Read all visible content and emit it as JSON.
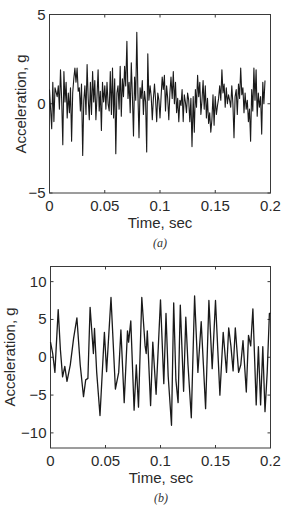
{
  "chart_data": [
    {
      "type": "line",
      "panel": "a",
      "caption": "(a)",
      "title": "",
      "xlabel": "Time, sec",
      "ylabel": "Acceleration, g",
      "xlim": [
        0,
        0.2
      ],
      "ylim": [
        -5,
        5
      ],
      "xticks": [
        0,
        0.05,
        0.1,
        0.15,
        0.2
      ],
      "xtick_labels": [
        "0",
        "0.05",
        "0.1",
        "0.15",
        "0.2"
      ],
      "yticks": [
        -5,
        0,
        5
      ],
      "ytick_labels": [
        "−5",
        "0",
        "5"
      ],
      "grid": false,
      "legend": null,
      "description": "Broadband random vibration signal, roughly zero mean, amplitude mostly within ±2 g, max peak about 4 g near t=0.08 s, min about −3 g",
      "x": [
        0.0,
        0.002,
        0.003,
        0.004,
        0.005,
        0.007,
        0.008,
        0.009,
        0.01,
        0.011,
        0.012,
        0.013,
        0.014,
        0.015,
        0.016,
        0.017,
        0.018,
        0.019,
        0.02,
        0.021,
        0.022,
        0.023,
        0.024,
        0.025,
        0.026,
        0.027,
        0.028,
        0.029,
        0.03,
        0.031,
        0.032,
        0.033,
        0.034,
        0.035,
        0.036,
        0.037,
        0.038,
        0.039,
        0.04,
        0.041,
        0.042,
        0.043,
        0.044,
        0.045,
        0.046,
        0.047,
        0.048,
        0.049,
        0.05,
        0.051,
        0.052,
        0.053,
        0.054,
        0.055,
        0.056,
        0.057,
        0.058,
        0.059,
        0.06,
        0.061,
        0.062,
        0.063,
        0.064,
        0.065,
        0.066,
        0.067,
        0.068,
        0.069,
        0.07,
        0.071,
        0.072,
        0.073,
        0.074,
        0.075,
        0.076,
        0.077,
        0.078,
        0.079,
        0.08,
        0.081,
        0.082,
        0.083,
        0.084,
        0.085,
        0.086,
        0.087,
        0.088,
        0.089,
        0.09,
        0.091,
        0.092,
        0.093,
        0.094,
        0.095,
        0.096,
        0.097,
        0.098,
        0.099,
        0.1,
        0.101,
        0.102,
        0.103,
        0.104,
        0.105,
        0.106,
        0.107,
        0.108,
        0.109,
        0.11,
        0.111,
        0.112,
        0.113,
        0.114,
        0.115,
        0.116,
        0.117,
        0.118,
        0.119,
        0.12,
        0.121,
        0.122,
        0.123,
        0.124,
        0.125,
        0.126,
        0.127,
        0.128,
        0.129,
        0.13,
        0.131,
        0.132,
        0.133,
        0.134,
        0.135,
        0.136,
        0.137,
        0.138,
        0.139,
        0.14,
        0.141,
        0.142,
        0.143,
        0.144,
        0.145,
        0.146,
        0.147,
        0.148,
        0.149,
        0.15,
        0.151,
        0.152,
        0.153,
        0.154,
        0.155,
        0.156,
        0.157,
        0.158,
        0.159,
        0.16,
        0.161,
        0.162,
        0.163,
        0.164,
        0.165,
        0.166,
        0.167,
        0.168,
        0.169,
        0.17,
        0.171,
        0.172,
        0.173,
        0.174,
        0.175,
        0.176,
        0.177,
        0.178,
        0.179,
        0.18,
        0.181,
        0.182,
        0.183,
        0.184,
        0.185,
        0.186,
        0.187,
        0.188,
        0.189,
        0.19,
        0.191,
        0.192,
        0.193,
        0.194,
        0.195,
        0.196,
        0.197,
        0.198,
        0.199,
        0.2
      ],
      "y": [
        0.8,
        -1.4,
        1.2,
        -1.0,
        0.9,
        0.4,
        1.0,
        -0.3,
        1.9,
        0.2,
        -2.3,
        1.8,
        0.1,
        1.2,
        -0.8,
        0.6,
        -0.5,
        0.9,
        -2.1,
        0.6,
        1.4,
        2.0,
        1.2,
        2.0,
        0.7,
        0.9,
        -0.4,
        1.1,
        -2.9,
        0.2,
        1.0,
        -0.6,
        2.2,
        0.3,
        -0.9,
        1.2,
        -0.6,
        1.8,
        0.1,
        1.3,
        -0.9,
        0.4,
        1.9,
        -0.4,
        0.7,
        -1.5,
        1.2,
        0.1,
        1.0,
        -0.3,
        1.2,
        0.0,
        -0.4,
        1.8,
        -0.6,
        2.0,
        -0.8,
        1.4,
        -2.8,
        0.6,
        1.0,
        -0.3,
        2.1,
        -0.7,
        1.4,
        0.4,
        2.1,
        1.0,
        3.5,
        0.3,
        1.2,
        -0.5,
        2.3,
        0.4,
        -1.8,
        1.5,
        0.2,
        4.0,
        0.6,
        -1.9,
        0.9,
        0.3,
        1.3,
        -0.6,
        0.7,
        0.1,
        -2.7,
        2.8,
        0.2,
        1.0,
        0.4,
        -0.9,
        0.3,
        1.1,
        0.2,
        -1.0,
        0.6,
        0.2,
        -0.8,
        0.4,
        1.5,
        0.8,
        1.6,
        -0.4,
        1.0,
        0.3,
        -0.9,
        0.6,
        1.5,
        0.3,
        1.8,
        0.0,
        1.2,
        -0.5,
        0.3,
        -1.0,
        0.2,
        -0.1,
        0.8,
        -1.0,
        0.5,
        0.1,
        -0.5,
        0.6,
        0.2,
        -1.0,
        0.3,
        -2.4,
        0.4,
        -1.6,
        0.8,
        -0.2,
        1.6,
        0.4,
        1.2,
        -0.6,
        0.2,
        1.3,
        -0.3,
        1.0,
        -0.8,
        0.3,
        -1.1,
        -0.5,
        -1.6,
        -0.9,
        0.5,
        -1.2,
        0.4,
        -0.6,
        -0.1,
        0.3,
        1.0,
        0.2,
        1.9,
        0.6,
        1.1,
        -0.2,
        0.9,
        0.0,
        0.5,
        0.2,
        -0.2,
        1.0,
        0.0,
        -1.9,
        0.4,
        0.8,
        -0.6,
        1.1,
        0.3,
        2.0,
        0.5,
        0.9,
        -0.5,
        0.6,
        -0.3,
        0.2,
        -1.0,
        -0.3,
        -2.1,
        0.8,
        -0.4,
        2.0,
        0.2,
        1.9,
        -0.7,
        0.6,
        -0.2,
        0.4,
        -1.7,
        1.2,
        0.0,
        1.3
      ]
    },
    {
      "type": "line",
      "panel": "b",
      "caption": "(b)",
      "title": "",
      "xlabel": "Time, sec",
      "ylabel": "Acceleration, g",
      "xlim": [
        0,
        0.2
      ],
      "ylim": [
        -12,
        12
      ],
      "xticks": [
        0,
        0.05,
        0.1,
        0.15,
        0.2
      ],
      "xtick_labels": [
        "0",
        "0.05",
        "0.1",
        "0.15",
        "0.2"
      ],
      "yticks": [
        -10,
        -5,
        0,
        5,
        10
      ],
      "ytick_labels": [
        "−10",
        "−5",
        "0",
        "5",
        "10"
      ],
      "grid": false,
      "legend": null,
      "description": "Smooth oscillatory (narrowband) vibration signal, peaks up to about 8 g, troughs down to about −9 g at t≈0.11 s",
      "x": [
        0.0,
        0.002,
        0.004,
        0.007,
        0.009,
        0.011,
        0.013,
        0.015,
        0.018,
        0.021,
        0.024,
        0.027,
        0.03,
        0.032,
        0.034,
        0.036,
        0.039,
        0.04,
        0.042,
        0.045,
        0.049,
        0.051,
        0.055,
        0.059,
        0.062,
        0.064,
        0.067,
        0.07,
        0.071,
        0.073,
        0.076,
        0.078,
        0.08,
        0.083,
        0.086,
        0.087,
        0.088,
        0.091,
        0.093,
        0.096,
        0.1,
        0.103,
        0.105,
        0.107,
        0.11,
        0.112,
        0.114,
        0.116,
        0.118,
        0.121,
        0.123,
        0.125,
        0.128,
        0.131,
        0.134,
        0.137,
        0.139,
        0.141,
        0.144,
        0.147,
        0.15,
        0.154,
        0.157,
        0.16,
        0.162,
        0.164,
        0.166,
        0.168,
        0.171,
        0.173,
        0.175,
        0.178,
        0.18,
        0.182,
        0.184,
        0.187,
        0.189,
        0.191,
        0.193,
        0.195,
        0.197,
        0.199,
        0.2
      ],
      "y": [
        2.0,
        0.5,
        -2.0,
        6.3,
        1.0,
        -2.6,
        -1.2,
        -3.2,
        -1.0,
        2.5,
        5.2,
        -1.0,
        -5.2,
        -3.0,
        -2.8,
        6.6,
        0.5,
        3.8,
        -2.0,
        -7.7,
        3.3,
        -1.9,
        7.9,
        -4.2,
        -2.0,
        3.6,
        -6.0,
        3.5,
        2.0,
        4.8,
        -7.0,
        -1.0,
        -6.6,
        7.9,
        1.5,
        0.5,
        3.5,
        -6.4,
        2.0,
        -4.9,
        7.6,
        -3.5,
        5.8,
        -2.5,
        -9.0,
        7.2,
        -3.0,
        -6.0,
        6.9,
        -4.5,
        5.3,
        -1.0,
        -8.0,
        8.1,
        -2.0,
        4.7,
        -1.0,
        -6.8,
        7.5,
        -1.5,
        7.5,
        -5.0,
        3.3,
        -2.0,
        3.9,
        1.5,
        -1.8,
        3.9,
        -2.0,
        -1.0,
        2.2,
        -4.6,
        2.9,
        1.5,
        6.4,
        -6.3,
        1.4,
        -6.3,
        1.4,
        -7.2,
        -2.0,
        5.8,
        5.8
      ]
    }
  ]
}
